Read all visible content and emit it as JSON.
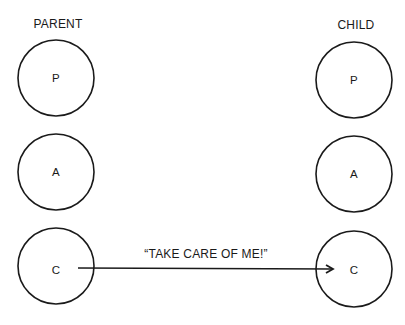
{
  "diagram": {
    "columns": [
      {
        "title": "PARENT",
        "nodes": [
          "P",
          "A",
          "C"
        ]
      },
      {
        "title": "CHILD",
        "nodes": [
          "P",
          "A",
          "C"
        ]
      }
    ],
    "arrow": {
      "from": "PARENT.C",
      "to": "CHILD.C",
      "label": "“TAKE CARE OF ME!”"
    },
    "colors": {
      "stroke": "#1a1a1a",
      "background": "#ffffff"
    }
  }
}
